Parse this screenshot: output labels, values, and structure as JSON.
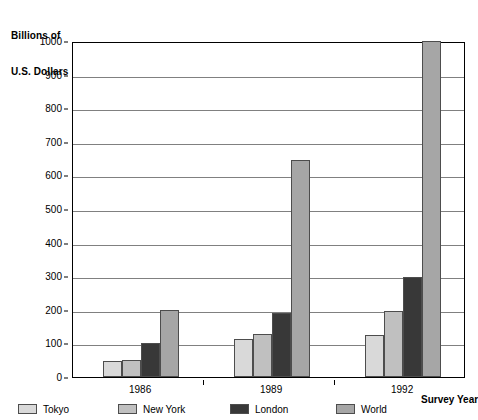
{
  "chart_data": {
    "type": "bar",
    "title": "",
    "ylabel_line1": "Billions of",
    "ylabel_line2": "U.S. Dollars",
    "ylabel": "Billions of U.S. Dollars",
    "xlabel": "Survey Year",
    "categories": [
      "1986",
      "1989",
      "1992"
    ],
    "series": [
      {
        "name": "Tokyo",
        "values": [
          48,
          112,
          125
        ],
        "color": "#d9d9d9"
      },
      {
        "name": "New York",
        "values": [
          52,
          128,
          195
        ],
        "color": "#c0c0c0"
      },
      {
        "name": "London",
        "values": [
          100,
          190,
          298
        ],
        "color": "#383838"
      },
      {
        "name": "World",
        "values": [
          200,
          645,
          1000
        ],
        "color": "#a6a6a6"
      }
    ],
    "ylim": [
      0,
      1000
    ],
    "ytick_labels": [
      "0",
      "100",
      "200",
      "300",
      "400",
      "500",
      "600",
      "700",
      "800",
      "900",
      "1000"
    ],
    "ytick_values": [
      0,
      100,
      200,
      300,
      400,
      500,
      600,
      700,
      800,
      900,
      1000
    ],
    "grid": true,
    "grid_color": "#808080",
    "legend_position": "bottom-left",
    "axis_color": "#000000",
    "background": "#ffffff"
  },
  "legend": {
    "items": [
      {
        "label": "Tokyo"
      },
      {
        "label": "New York"
      },
      {
        "label": "London"
      },
      {
        "label": "World"
      }
    ]
  }
}
